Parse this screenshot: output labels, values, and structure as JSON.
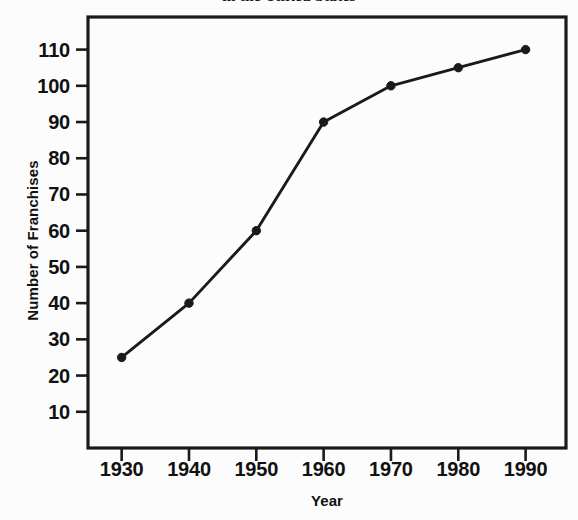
{
  "chart_data": {
    "type": "line",
    "title": "in the United States",
    "xlabel": "Year",
    "ylabel": "Number of Franchises",
    "x": [
      1930,
      1940,
      1950,
      1960,
      1970,
      1980,
      1990
    ],
    "values": [
      25,
      40,
      60,
      90,
      100,
      105,
      110
    ],
    "series": [
      {
        "name": "Number of Franchises",
        "values": [
          25,
          40,
          60,
          90,
          100,
          105,
          110
        ]
      }
    ],
    "xticklabels": [
      "1930",
      "1940",
      "1950",
      "1960",
      "1970",
      "1980",
      "1990"
    ],
    "yticklabels": [
      "10",
      "20",
      "30",
      "40",
      "50",
      "60",
      "70",
      "80",
      "90",
      "100",
      "110"
    ],
    "yticks": [
      10,
      20,
      30,
      40,
      50,
      60,
      70,
      80,
      90,
      100,
      110
    ],
    "xlim": [
      1925,
      1996
    ],
    "ylim": [
      0,
      119
    ],
    "grid": false,
    "legend": false,
    "marker": "filled-circle",
    "line_color": "#1a1a1a",
    "marker_color": "#1a1a1a",
    "frame_color": "#1a1a1a",
    "background_color": "#fcfcfc"
  },
  "axes": {
    "title": "in the United States",
    "x_title": "Year",
    "y_title": "Number of Franchises"
  }
}
